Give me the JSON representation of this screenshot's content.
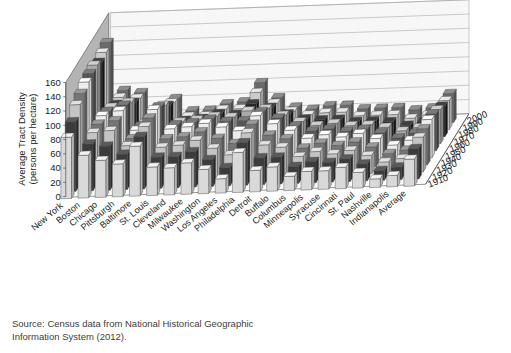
{
  "source": {
    "line1": "Source: Census data from National Historical Geographic",
    "line2": "Information System (2012)."
  },
  "colors": {
    "back_wall": "#f7f7f7",
    "left_wall": "#b4b4b4",
    "floor": "#ffffff",
    "gridline": "#9a9a9a",
    "outline": "#4d4d4d",
    "text": "#1b1b1b"
  },
  "chart_data": {
    "type": "bar",
    "title": "",
    "subtitle": "",
    "xlabel": "",
    "ylabel": "Average Tract Density\n(persons per hectare)",
    "ylabel_line1": "Average Tract Density",
    "ylabel_line2": "(persons per hectare)",
    "zlabel": "",
    "ylim": [
      0,
      160
    ],
    "yticks": [
      0,
      20,
      40,
      60,
      80,
      100,
      120,
      140,
      160
    ],
    "grid": true,
    "legend_position": "axis-right",
    "projection": "3d",
    "categories": [
      "New York",
      "Boston",
      "Chicago",
      "Pittsburgh",
      "Baltimore",
      "St. Louis",
      "Cleveland",
      "Milwaukee",
      "Washington",
      "Los Angeles",
      "Philadelphia",
      "Detroit",
      "Buffalo",
      "Columbus",
      "Minneapolis",
      "Syracuse",
      "Cincinnati",
      "St. Paul",
      "Nashville",
      "Indianapolis",
      "Average"
    ],
    "series": [
      {
        "name": "1910",
        "values": [
          86,
          60,
          52,
          46,
          70,
          40,
          38,
          44,
          34,
          20,
          56,
          30,
          34,
          20,
          26,
          26,
          30,
          22,
          12,
          16,
          38
        ]
      },
      {
        "name": "1920",
        "values": [
          98,
          66,
          62,
          50,
          74,
          44,
          44,
          50,
          38,
          26,
          60,
          38,
          38,
          24,
          30,
          28,
          32,
          24,
          14,
          18,
          43
        ]
      },
      {
        "name": "1930",
        "values": [
          112,
          72,
          74,
          52,
          78,
          48,
          50,
          56,
          44,
          34,
          64,
          46,
          42,
          28,
          34,
          30,
          34,
          26,
          16,
          20,
          49
        ]
      },
      {
        "name": "1940",
        "values": [
          118,
          74,
          78,
          52,
          80,
          50,
          52,
          58,
          48,
          40,
          66,
          50,
          44,
          30,
          36,
          32,
          36,
          28,
          18,
          22,
          51
        ]
      },
      {
        "name": "1950",
        "values": [
          124,
          76,
          82,
          54,
          82,
          54,
          56,
          60,
          54,
          48,
          68,
          56,
          46,
          34,
          38,
          34,
          38,
          30,
          20,
          26,
          54
        ]
      },
      {
        "name": "1960",
        "values": [
          126,
          72,
          80,
          50,
          76,
          50,
          52,
          56,
          52,
          52,
          64,
          54,
          42,
          34,
          36,
          32,
          34,
          28,
          20,
          26,
          52
        ]
      },
      {
        "name": "1970",
        "values": [
          128,
          68,
          74,
          44,
          68,
          44,
          46,
          50,
          48,
          56,
          58,
          48,
          38,
          32,
          34,
          30,
          30,
          26,
          20,
          24,
          48
        ]
      },
      {
        "name": "1980",
        "values": [
          122,
          62,
          64,
          38,
          58,
          36,
          38,
          44,
          42,
          56,
          50,
          40,
          32,
          30,
          30,
          26,
          26,
          24,
          18,
          22,
          43
        ]
      },
      {
        "name": "1990",
        "values": [
          126,
          62,
          60,
          34,
          52,
          32,
          32,
          40,
          40,
          62,
          46,
          34,
          28,
          30,
          30,
          24,
          24,
          24,
          18,
          22,
          41
        ]
      },
      {
        "name": "2000",
        "values": [
          130,
          62,
          58,
          32,
          48,
          30,
          30,
          38,
          40,
          66,
          44,
          30,
          26,
          30,
          30,
          24,
          24,
          24,
          20,
          22,
          41
        ]
      }
    ]
  }
}
